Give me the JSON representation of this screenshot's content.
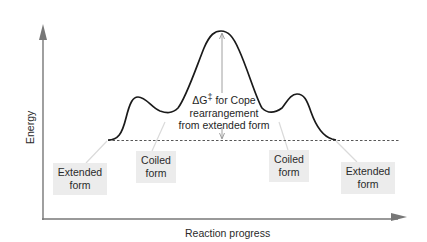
{
  "diagram": {
    "type": "reaction-energy-profile",
    "axes": {
      "y_label": "Energy",
      "x_label": "Reaction progress"
    },
    "annotation": {
      "line1_prefix": "ΔG",
      "line1_sup": "‡",
      "line1_suffix": " for Cope",
      "line2": "rearrangement",
      "line3": "from extended form"
    },
    "states": [
      {
        "id": "extended-left",
        "line1": "Extended",
        "line2": "form"
      },
      {
        "id": "coiled-left",
        "line1": "Coiled",
        "line2": "form"
      },
      {
        "id": "coiled-right",
        "line1": "Coiled",
        "line2": "form"
      },
      {
        "id": "extended-right",
        "line1": "Extended",
        "line2": "form"
      }
    ],
    "colors": {
      "axis": "#777777",
      "curve": "#1a1a1a",
      "label_bg": "#ececec",
      "pointer": "#d9d9d9"
    }
  }
}
